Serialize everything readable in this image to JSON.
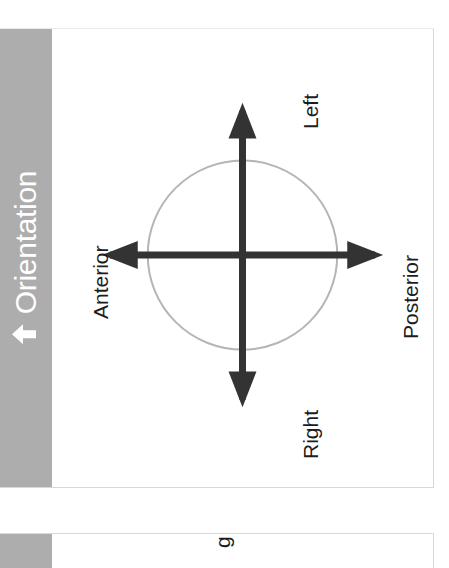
{
  "window": {
    "background_color": "#ffffff"
  },
  "panels": [
    {
      "id": "orientation",
      "header": {
        "title": "Orientation",
        "collapse_icon": "arrow-up-icon",
        "background_color": "#adadad",
        "text_color": "#ffffff"
      },
      "diagram": {
        "type": "anatomical-orientation",
        "circle_color": "#b5b5b5",
        "axis_color": "#333333",
        "label_color": "#1d1d1d",
        "labels": {
          "up": "Left",
          "down": "Right",
          "left": "Anterior",
          "right": "Posterior"
        }
      }
    },
    {
      "id": "second-panel",
      "header": {
        "title": "",
        "background_color": "#adadad"
      },
      "clipped_text": "g"
    }
  ]
}
